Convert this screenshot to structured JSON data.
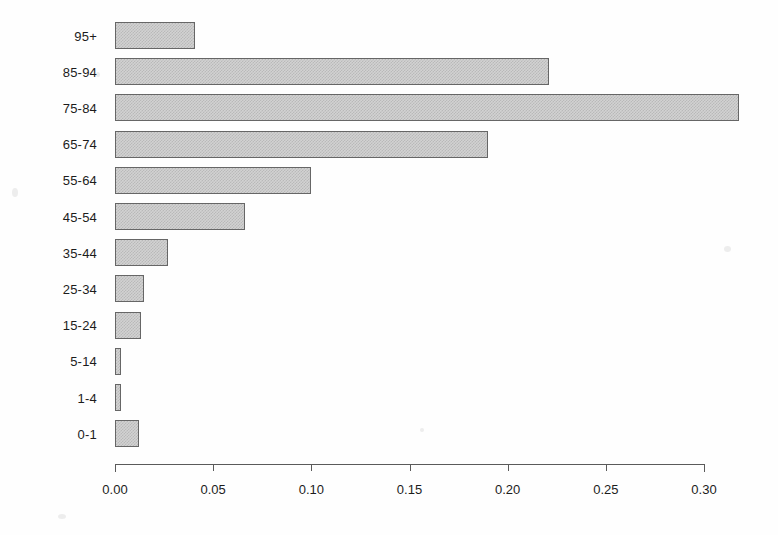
{
  "chart_data": {
    "type": "bar",
    "orientation": "horizontal",
    "title": "",
    "subtitle": "",
    "xlabel": "",
    "ylabel": "",
    "categories": [
      "0-1",
      "1-4",
      "5-14",
      "15-24",
      "25-34",
      "35-44",
      "45-54",
      "55-64",
      "65-74",
      "75-84",
      "85-94",
      "95+"
    ],
    "values": [
      0.012,
      0.003,
      0.003,
      0.013,
      0.015,
      0.027,
      0.066,
      0.1,
      0.19,
      0.318,
      0.221,
      0.041
    ],
    "category_order_top_to_bottom": [
      "95+",
      "85-94",
      "75-84",
      "65-74",
      "55-64",
      "45-54",
      "35-44",
      "25-34",
      "15-24",
      "5-14",
      "1-4",
      "0-1"
    ],
    "values_top_to_bottom": [
      0.041,
      0.221,
      0.318,
      0.19,
      0.1,
      0.066,
      0.027,
      0.015,
      0.013,
      0.003,
      0.003,
      0.012
    ],
    "xlim": [
      0.0,
      0.3
    ],
    "xticks": [
      0.0,
      0.05,
      0.1,
      0.15,
      0.2,
      0.25,
      0.3
    ],
    "xticklabels": [
      "0.00",
      "0.05",
      "0.10",
      "0.15",
      "0.20",
      "0.25",
      "0.30"
    ],
    "grid": false,
    "legend": null,
    "legend_position": "none",
    "bar_fill_color": "#d2d2d2",
    "bar_edge_color": "#666666",
    "bar_fill_pattern": "fine-checkerboard-dither",
    "axis_color": "#5a5a5a",
    "background_color": "#ffffff"
  },
  "axes": {
    "y_axis": {
      "name": "age-group",
      "labels_top_to_bottom": [
        "95+",
        "85-94",
        "75-84",
        "65-74",
        "55-64",
        "45-54",
        "35-44",
        "25-34",
        "15-24",
        "5-14",
        "1-4",
        "0-1"
      ]
    },
    "x_axis": {
      "name": "proportion",
      "tick_labels": [
        "0.00",
        "0.05",
        "0.10",
        "0.15",
        "0.20",
        "0.25",
        "0.30"
      ]
    }
  }
}
